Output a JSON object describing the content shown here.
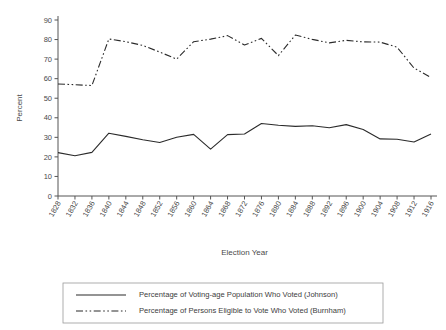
{
  "chart_data": {
    "type": "line",
    "title": "",
    "xlabel": "Election Year",
    "ylabel": "Percent",
    "ylim": [
      0,
      90
    ],
    "ytick_step": 10,
    "grid": false,
    "legend_position": "bottom",
    "categories": [
      "1828",
      "1832",
      "1836",
      "1840",
      "1844",
      "1848",
      "1852",
      "1856",
      "1860",
      "1864",
      "1868",
      "1872",
      "1876",
      "1880",
      "1884",
      "1888",
      "1892",
      "1896",
      "1900",
      "1904",
      "1908",
      "1912",
      "1916"
    ],
    "yticks": [
      "0",
      "10",
      "20",
      "30",
      "40",
      "50",
      "60",
      "70",
      "80",
      "90"
    ],
    "series": [
      {
        "name": "Percentage of Voting-age Population Who Voted (Johnson)",
        "style": "solid",
        "values": [
          22.2,
          20.6,
          22.3,
          32.1,
          30.5,
          28.8,
          27.4,
          30.0,
          31.5,
          24.0,
          31.4,
          31.7,
          37.1,
          36.2,
          35.6,
          35.9,
          34.9,
          36.5,
          34.0,
          29.2,
          29.0,
          27.6,
          31.7
        ]
      },
      {
        "name": "Percentage of Persons Eligible to Vote Who Voted (Burnham)",
        "style": "dashdot",
        "values": [
          57.3,
          56.9,
          56.5,
          80.3,
          78.9,
          77.0,
          73.6,
          70.0,
          78.9,
          80.2,
          82.0,
          77.2,
          80.6,
          71.8,
          82.3,
          80.1,
          78.3,
          79.6,
          78.8,
          78.7,
          76.1,
          65.4,
          60.6
        ]
      }
    ]
  },
  "legend": {
    "entries": [
      {
        "label": "Percentage of Voting-age Population Who Voted (Johnson)"
      },
      {
        "label": "Percentage of Persons Eligible to Vote Who Voted (Burnham)"
      }
    ]
  }
}
